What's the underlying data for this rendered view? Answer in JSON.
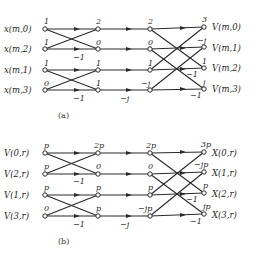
{
  "figure_a": {
    "caption": "(a)",
    "inputs": [
      {
        "label": "x(m,0)",
        "value": "1"
      },
      {
        "label": "x(m,2)",
        "value": "1"
      },
      {
        "label": "x(m,1)",
        "value": "1"
      },
      {
        "label": "x(m,3)",
        "value": "0"
      }
    ],
    "stage1": [
      "2",
      "0",
      "1",
      "1"
    ],
    "stage2": [
      "2",
      "0",
      "1",
      "−j"
    ],
    "outputs": [
      {
        "label": "V(m,0)",
        "value": "3"
      },
      {
        "label": "V(m,1)",
        "value": "−j"
      },
      {
        "label": "V(m,2)",
        "value": "1"
      },
      {
        "label": "V(m,3)",
        "value": "j"
      }
    ],
    "multipliers": {
      "stage1_row1": "−1",
      "stage1_row3": "−1",
      "twiddle_row3": "−j",
      "stage3_row2": "−1",
      "stage3_row3": "−1"
    }
  },
  "figure_b": {
    "caption": "(b)",
    "inputs": [
      {
        "label": "V(0,r)",
        "value": "p"
      },
      {
        "label": "V(2,r)",
        "value": "p"
      },
      {
        "label": "V(1,r)",
        "value": "p"
      },
      {
        "label": "V(3,r)",
        "value": "0"
      }
    ],
    "stage1": [
      "2p",
      "0",
      "p",
      "p"
    ],
    "stage2": [
      "2p",
      "0",
      "p",
      "−jp"
    ],
    "outputs": [
      {
        "label": "X(0,r)",
        "value": "3p"
      },
      {
        "label": "X(1,r)",
        "value": "−jp"
      },
      {
        "label": "X(2,r)",
        "value": "p"
      },
      {
        "label": "X(3,r)",
        "value": "jp"
      }
    ],
    "multipliers": {
      "stage1_row1": "−1",
      "stage1_row3": "−1",
      "twiddle_row3": "−j",
      "stage3_row2": "−1",
      "stage3_row3": "−1"
    }
  }
}
